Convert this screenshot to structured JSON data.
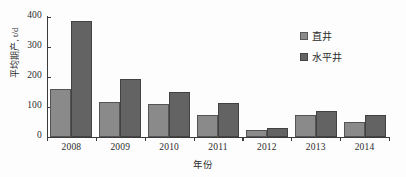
{
  "chart_data": {
    "type": "bar",
    "title": "",
    "subtitle": "",
    "xlabel": "年份",
    "ylabel": "平均期产, t/d",
    "categories": [
      "2008",
      "2009",
      "2010",
      "2011",
      "2012",
      "2013",
      "2014"
    ],
    "series": [
      {
        "name": "直井",
        "values": [
          160,
          117,
          110,
          73,
          22,
          72,
          50
        ],
        "color": "#8a8a8a"
      },
      {
        "name": "水平井",
        "values": [
          387,
          193,
          150,
          112,
          31,
          86,
          75
        ],
        "color": "#636363"
      }
    ],
    "ylim": [
      0,
      400
    ],
    "yticks": [
      0,
      100,
      200,
      300,
      400
    ],
    "ytick_labels": [
      "0",
      "100",
      "200",
      "300",
      "400"
    ],
    "grid": false,
    "legend_position": "top-right"
  },
  "legend": {
    "entries": [
      {
        "label": "直井"
      },
      {
        "label": "水平井"
      }
    ]
  }
}
